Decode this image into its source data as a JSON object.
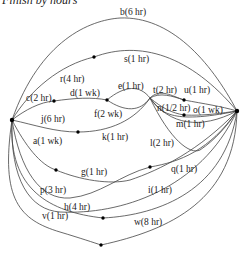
{
  "title": "Finish by hours",
  "nodes": {
    "source": {
      "x": 12,
      "y": 120
    },
    "sink": {
      "x": 237,
      "y": 111
    },
    "n_cd": {
      "x": 54,
      "y": 101
    },
    "n_def": {
      "x": 107,
      "y": 100
    },
    "n_rs": {
      "x": 94,
      "y": 57
    },
    "n_jk": {
      "x": 78,
      "y": 132
    },
    "n_tu": {
      "x": 184,
      "y": 100
    },
    "n_no": {
      "x": 184,
      "y": 115
    },
    "n_ag": {
      "x": 56,
      "y": 170
    },
    "n_gq": {
      "x": 150,
      "y": 167
    },
    "n_hw": {
      "x": 103,
      "y": 218
    },
    "n_v": {
      "x": 101,
      "y": 245
    }
  },
  "edges": [
    {
      "id": "a",
      "label": "a(1 wk)"
    },
    {
      "id": "b",
      "label": "b(6 hr)"
    },
    {
      "id": "c",
      "label": "c(2 hr)"
    },
    {
      "id": "d",
      "label": "d(1 wk)"
    },
    {
      "id": "e",
      "label": "e(1 hr)"
    },
    {
      "id": "f",
      "label": "f(2 wk)"
    },
    {
      "id": "g",
      "label": "g(1 hr)"
    },
    {
      "id": "h",
      "label": "h(4 hr)"
    },
    {
      "id": "i",
      "label": "i(1 hr)"
    },
    {
      "id": "j",
      "label": "j(6 hr)"
    },
    {
      "id": "k",
      "label": "k(1 hr)"
    },
    {
      "id": "l",
      "label": "l(2 hr)"
    },
    {
      "id": "m",
      "label": "m(1 hr)"
    },
    {
      "id": "n",
      "label": "n(1/2 hr)"
    },
    {
      "id": "o",
      "label": "o(1 wk)"
    },
    {
      "id": "p",
      "label": "p(3 hr)"
    },
    {
      "id": "q",
      "label": "q(1 hr)"
    },
    {
      "id": "r",
      "label": "r(4 hr)"
    },
    {
      "id": "s",
      "label": "s(1 hr)"
    },
    {
      "id": "t",
      "label": "t(2 hr)"
    },
    {
      "id": "u",
      "label": "u(1 hr)"
    },
    {
      "id": "v",
      "label": "v(1 hr)"
    },
    {
      "id": "w",
      "label": "w(8 hr)"
    }
  ],
  "labels": {
    "a": "a(1 wk)",
    "b": "b(6 hr)",
    "c": "c(2 hr)",
    "d": "d(1 wk)",
    "e": "e(1 hr)",
    "f": "f(2 wk)",
    "g": "g(1 hr)",
    "h": "h(4 hr)",
    "i": "i(1 hr)",
    "j": "j(6 hr)",
    "k": "k(1 hr)",
    "l": "l(2 hr)",
    "m": "m(1 hr)",
    "n": "n(1/2 hr)",
    "o": "o(1 wk)",
    "p": "p(3 hr)",
    "q": "q(1 hr)",
    "r": "r(4 hr)",
    "s": "s(1 hr)",
    "t": "t(2 hr)",
    "u": "u(1 hr)",
    "v": "v(1 hr)",
    "w": "w(8 hr)"
  }
}
